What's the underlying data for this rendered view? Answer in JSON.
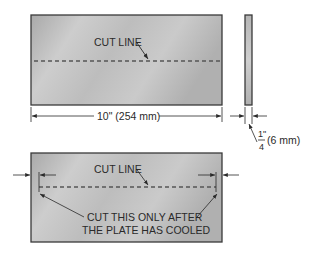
{
  "top_view": {
    "cut_line_label": "CUT LINE",
    "width_dimension": "10\" (254 mm)"
  },
  "side_view": {
    "thickness_numerator": "1\"",
    "thickness_denominator": "4",
    "thickness_metric": "(6 mm)"
  },
  "bottom_view": {
    "cut_line_label": "CUT LINE",
    "note_line1": "CUT THIS ONLY AFTER",
    "note_line2": "THE PLATE HAS COOLED"
  },
  "colors": {
    "plate_light": "#d2d2d2",
    "plate_dark": "#a8a8a8",
    "outline": "#3a3a3a",
    "dash": "#555555"
  }
}
